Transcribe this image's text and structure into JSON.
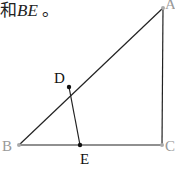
{
  "caption": {
    "prefix": "和",
    "segment": "BE",
    "suffix": " 。"
  },
  "diagram": {
    "points": {
      "A": {
        "label": "A",
        "x": 163,
        "y": 8,
        "color": "#999999"
      },
      "B": {
        "label": "B",
        "x": 19,
        "y": 145,
        "color": "#999999"
      },
      "C": {
        "label": "C",
        "x": 162,
        "y": 145,
        "color": "#999999"
      },
      "D": {
        "label": "D",
        "x": 69,
        "y": 87,
        "color": "#111111"
      },
      "E": {
        "label": "E",
        "x": 80,
        "y": 145,
        "color": "#111111"
      }
    },
    "segments": [
      "AB",
      "AC",
      "BC",
      "DE"
    ]
  }
}
